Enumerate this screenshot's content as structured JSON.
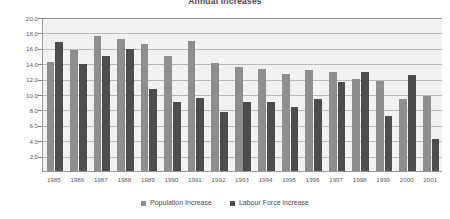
{
  "chart_data": {
    "type": "bar",
    "title": "Annual Increases",
    "xlabel": "",
    "ylabel": "million",
    "ylim": [
      0,
      20
    ],
    "ytick_step": 2,
    "ytick_labels": [
      "20.0",
      "18.0",
      "16.0",
      "14.0",
      "12.0",
      "10.0",
      "8.0",
      "6.0",
      "4.0",
      "2.0",
      "0.0"
    ],
    "grid": true,
    "legend_position": "bottom",
    "categories": [
      "1985",
      "1986",
      "1987",
      "1988",
      "1989",
      "1990",
      "1991",
      "1992",
      "1993",
      "1994",
      "1995",
      "1996",
      "1997",
      "1998",
      "1999",
      "2000",
      "2001"
    ],
    "series": [
      {
        "name": "Population Increase",
        "color": "#8e8e8e",
        "values": [
          14.2,
          15.7,
          17.5,
          17.1,
          16.5,
          15.0,
          16.9,
          14.0,
          13.5,
          13.3,
          12.6,
          13.1,
          12.8,
          12.0,
          11.7,
          9.4,
          9.7
        ]
      },
      {
        "name": "Labour Force increase",
        "color": "#4d4d4d",
        "values": [
          16.8,
          13.9,
          14.9,
          15.9,
          10.6,
          9.0,
          9.5,
          7.6,
          8.9,
          8.9,
          8.3,
          9.4,
          11.6,
          12.8,
          7.2,
          12.5,
          4.2
        ]
      }
    ]
  },
  "legend": {
    "items": [
      {
        "label": "Population Increase"
      },
      {
        "label": "Labour Force increase"
      }
    ]
  }
}
